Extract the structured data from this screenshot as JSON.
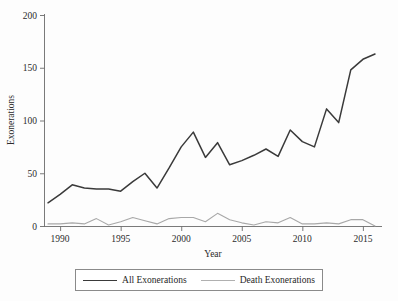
{
  "chart_data": {
    "type": "line",
    "title": "",
    "xlabel": "Year",
    "ylabel": "Exonerations",
    "xlim": [
      1989,
      2016
    ],
    "ylim": [
      0,
      200
    ],
    "grid": false,
    "legend_position": "bottom",
    "x": [
      1989,
      1990,
      1991,
      1992,
      1993,
      1994,
      1995,
      1996,
      1997,
      1998,
      1999,
      2000,
      2001,
      2002,
      2003,
      2004,
      2005,
      2006,
      2007,
      2008,
      2009,
      2010,
      2011,
      2012,
      2013,
      2014,
      2015,
      2016
    ],
    "xticks": [
      1990,
      1995,
      2000,
      2005,
      2010,
      2015
    ],
    "yticks": [
      0,
      50,
      100,
      150,
      200
    ],
    "series": [
      {
        "name": "All Exonerations",
        "color": "#3a3a3a",
        "values": [
          22,
          30,
          39,
          36,
          35,
          35,
          33,
          42,
          50,
          36,
          55,
          75,
          89,
          65,
          79,
          58,
          62,
          67,
          73,
          66,
          91,
          80,
          75,
          111,
          98,
          148,
          158,
          163
        ]
      },
      {
        "name": "Death Exonerations",
        "color": "#a8a8a8",
        "values": [
          2,
          2,
          3,
          2,
          7,
          1,
          4,
          8,
          5,
          2,
          7,
          8,
          8,
          4,
          12,
          6,
          3,
          1,
          4,
          3,
          8,
          2,
          2,
          3,
          2,
          6,
          6,
          0
        ]
      }
    ]
  },
  "axis": {
    "ylabel": "Exonerations",
    "xlabel": "Year",
    "ytick_labels": [
      "0",
      "50",
      "100",
      "150",
      "200"
    ],
    "xtick_labels": [
      "1990",
      "1995",
      "2000",
      "2005",
      "2010",
      "2015"
    ]
  },
  "legend": {
    "entries": [
      {
        "label": "All Exonerations",
        "style": "all"
      },
      {
        "label": "Death Exonerations",
        "style": "death"
      }
    ]
  }
}
